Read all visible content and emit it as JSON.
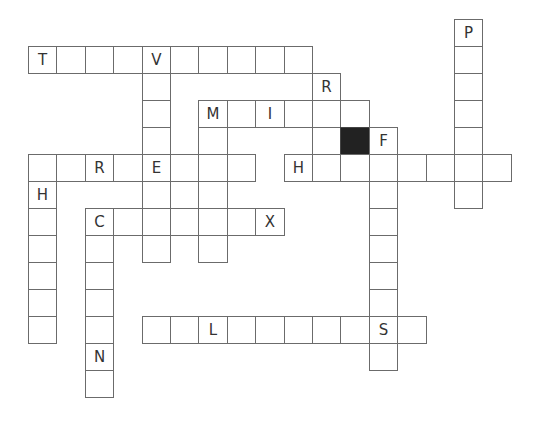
{
  "puzzle": {
    "type": "crossword",
    "cell_width": 28.4,
    "cell_height": 27,
    "origin_x": 28,
    "origin_y": 19,
    "colors": {
      "border": "#6b6b6b",
      "blocked": "#222222",
      "letter": "#333333",
      "background": "#ffffff"
    },
    "cells": [
      {
        "r": 0,
        "c": 15,
        "l": "P"
      },
      {
        "r": 1,
        "c": 0,
        "l": "T"
      },
      {
        "r": 1,
        "c": 1,
        "l": ""
      },
      {
        "r": 1,
        "c": 2,
        "l": ""
      },
      {
        "r": 1,
        "c": 3,
        "l": ""
      },
      {
        "r": 1,
        "c": 4,
        "l": "V"
      },
      {
        "r": 1,
        "c": 5,
        "l": ""
      },
      {
        "r": 1,
        "c": 6,
        "l": ""
      },
      {
        "r": 1,
        "c": 7,
        "l": ""
      },
      {
        "r": 1,
        "c": 8,
        "l": ""
      },
      {
        "r": 1,
        "c": 9,
        "l": ""
      },
      {
        "r": 1,
        "c": 15,
        "l": ""
      },
      {
        "r": 2,
        "c": 4,
        "l": ""
      },
      {
        "r": 2,
        "c": 10,
        "l": "R"
      },
      {
        "r": 2,
        "c": 15,
        "l": ""
      },
      {
        "r": 3,
        "c": 4,
        "l": ""
      },
      {
        "r": 3,
        "c": 6,
        "l": "M"
      },
      {
        "r": 3,
        "c": 7,
        "l": ""
      },
      {
        "r": 3,
        "c": 8,
        "l": "I"
      },
      {
        "r": 3,
        "c": 9,
        "l": ""
      },
      {
        "r": 3,
        "c": 10,
        "l": ""
      },
      {
        "r": 3,
        "c": 11,
        "l": ""
      },
      {
        "r": 3,
        "c": 15,
        "l": ""
      },
      {
        "r": 4,
        "c": 4,
        "l": ""
      },
      {
        "r": 4,
        "c": 6,
        "l": ""
      },
      {
        "r": 4,
        "c": 10,
        "l": ""
      },
      {
        "r": 4,
        "c": 11,
        "l": "",
        "black": true
      },
      {
        "r": 4,
        "c": 12,
        "l": "F"
      },
      {
        "r": 4,
        "c": 15,
        "l": ""
      },
      {
        "r": 5,
        "c": 0,
        "l": ""
      },
      {
        "r": 5,
        "c": 1,
        "l": ""
      },
      {
        "r": 5,
        "c": 2,
        "l": "R"
      },
      {
        "r": 5,
        "c": 3,
        "l": ""
      },
      {
        "r": 5,
        "c": 4,
        "l": "E"
      },
      {
        "r": 5,
        "c": 5,
        "l": ""
      },
      {
        "r": 5,
        "c": 6,
        "l": ""
      },
      {
        "r": 5,
        "c": 7,
        "l": ""
      },
      {
        "r": 5,
        "c": 9,
        "l": "H"
      },
      {
        "r": 5,
        "c": 10,
        "l": ""
      },
      {
        "r": 5,
        "c": 11,
        "l": ""
      },
      {
        "r": 5,
        "c": 12,
        "l": ""
      },
      {
        "r": 5,
        "c": 13,
        "l": ""
      },
      {
        "r": 5,
        "c": 14,
        "l": ""
      },
      {
        "r": 5,
        "c": 15,
        "l": ""
      },
      {
        "r": 5,
        "c": 16,
        "l": ""
      },
      {
        "r": 6,
        "c": 0,
        "l": "H"
      },
      {
        "r": 6,
        "c": 4,
        "l": ""
      },
      {
        "r": 6,
        "c": 6,
        "l": ""
      },
      {
        "r": 6,
        "c": 12,
        "l": ""
      },
      {
        "r": 6,
        "c": 15,
        "l": ""
      },
      {
        "r": 7,
        "c": 0,
        "l": ""
      },
      {
        "r": 7,
        "c": 2,
        "l": "C"
      },
      {
        "r": 7,
        "c": 3,
        "l": ""
      },
      {
        "r": 7,
        "c": 4,
        "l": ""
      },
      {
        "r": 7,
        "c": 5,
        "l": ""
      },
      {
        "r": 7,
        "c": 6,
        "l": ""
      },
      {
        "r": 7,
        "c": 7,
        "l": ""
      },
      {
        "r": 7,
        "c": 8,
        "l": "X"
      },
      {
        "r": 7,
        "c": 12,
        "l": ""
      },
      {
        "r": 8,
        "c": 0,
        "l": ""
      },
      {
        "r": 8,
        "c": 2,
        "l": ""
      },
      {
        "r": 8,
        "c": 4,
        "l": ""
      },
      {
        "r": 8,
        "c": 6,
        "l": ""
      },
      {
        "r": 8,
        "c": 12,
        "l": ""
      },
      {
        "r": 9,
        "c": 0,
        "l": ""
      },
      {
        "r": 9,
        "c": 2,
        "l": ""
      },
      {
        "r": 9,
        "c": 12,
        "l": ""
      },
      {
        "r": 10,
        "c": 0,
        "l": ""
      },
      {
        "r": 10,
        "c": 2,
        "l": ""
      },
      {
        "r": 10,
        "c": 12,
        "l": ""
      },
      {
        "r": 11,
        "c": 0,
        "l": ""
      },
      {
        "r": 11,
        "c": 2,
        "l": ""
      },
      {
        "r": 11,
        "c": 4,
        "l": ""
      },
      {
        "r": 11,
        "c": 5,
        "l": ""
      },
      {
        "r": 11,
        "c": 6,
        "l": "L"
      },
      {
        "r": 11,
        "c": 7,
        "l": ""
      },
      {
        "r": 11,
        "c": 8,
        "l": ""
      },
      {
        "r": 11,
        "c": 9,
        "l": ""
      },
      {
        "r": 11,
        "c": 10,
        "l": ""
      },
      {
        "r": 11,
        "c": 11,
        "l": ""
      },
      {
        "r": 11,
        "c": 12,
        "l": "S"
      },
      {
        "r": 11,
        "c": 13,
        "l": ""
      },
      {
        "r": 12,
        "c": 2,
        "l": "N"
      },
      {
        "r": 12,
        "c": 12,
        "l": ""
      },
      {
        "r": 13,
        "c": 2,
        "l": ""
      }
    ]
  }
}
